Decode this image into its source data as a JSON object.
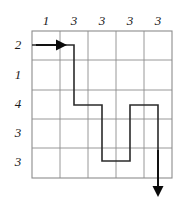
{
  "figure": {
    "background_color": "#ffffff",
    "grid": {
      "columns": 5,
      "rows": 5,
      "x0": 32,
      "y0": 31,
      "cell_w": 28,
      "cell_h": 29.4,
      "line_color": "#8c8c8c",
      "border_color": "#8c8c8c"
    },
    "column_labels": [
      "1",
      "3",
      "3",
      "3",
      "3"
    ],
    "row_labels": [
      "2",
      "1",
      "4",
      "3",
      "3"
    ],
    "path": {
      "color": "#2b2b2b",
      "points": [
        [
          32,
          45
        ],
        [
          74,
          45
        ],
        [
          74,
          105
        ],
        [
          102,
          105
        ],
        [
          102,
          161
        ],
        [
          130,
          161
        ],
        [
          130,
          105
        ],
        [
          158,
          105
        ],
        [
          158,
          190
        ]
      ]
    },
    "entry_arrow": {
      "color": "#0a0a0a",
      "x1": 36,
      "x2": 58,
      "y": 45,
      "direction": "right"
    },
    "exit_arrow": {
      "color": "#0a0a0a",
      "x": 158,
      "y1": 150,
      "y2": 196,
      "direction": "down"
    }
  }
}
